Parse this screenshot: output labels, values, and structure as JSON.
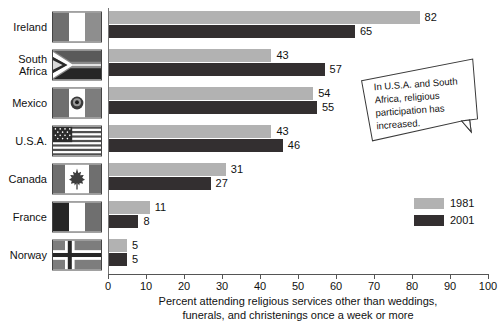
{
  "chart_data": {
    "type": "bar",
    "orientation": "horizontal",
    "title": "",
    "xlabel_line1": "Percent attending religious services other than weddings,",
    "xlabel_line2": "funerals, and christenings once a week or more",
    "ylabel": "",
    "xlim": [
      0,
      100
    ],
    "xticks": [
      0,
      10,
      20,
      30,
      40,
      50,
      60,
      70,
      80,
      90,
      100
    ],
    "xtick_labels": [
      "0",
      "10",
      "20",
      "30",
      "40",
      "50",
      "60",
      "70",
      "80",
      "90",
      "100"
    ],
    "grid": false,
    "legend_position": "right",
    "categories": [
      "Ireland",
      "South Africa",
      "Mexico",
      "U.S.A.",
      "Canada",
      "France",
      "Norway"
    ],
    "series": [
      {
        "name": "1981",
        "color": "#b2b2b2",
        "values": [
          82,
          43,
          54,
          43,
          31,
          11,
          5
        ]
      },
      {
        "name": "2001",
        "color": "#332f30",
        "values": [
          65,
          57,
          55,
          46,
          27,
          8,
          5
        ]
      }
    ],
    "annotations": [
      {
        "text": "In U.S.A. and South Africa, religious participation has increased."
      }
    ]
  },
  "rows": [
    {
      "label_line1": "Ireland",
      "label_line2": "",
      "flag": "flag-ireland",
      "v1981": 82,
      "v2001": 65,
      "v1981_text": "82",
      "v2001_text": "65"
    },
    {
      "label_line1": "South",
      "label_line2": "Africa",
      "flag": "flag-south-africa",
      "v1981": 43,
      "v2001": 57,
      "v1981_text": "43",
      "v2001_text": "57"
    },
    {
      "label_line1": "Mexico",
      "label_line2": "",
      "flag": "flag-mexico",
      "v1981": 54,
      "v2001": 55,
      "v1981_text": "54",
      "v2001_text": "55"
    },
    {
      "label_line1": "U.S.A.",
      "label_line2": "",
      "flag": "flag-usa",
      "v1981": 43,
      "v2001": 46,
      "v1981_text": "43",
      "v2001_text": "46"
    },
    {
      "label_line1": "Canada",
      "label_line2": "",
      "flag": "flag-canada",
      "v1981": 31,
      "v2001": 27,
      "v1981_text": "31",
      "v2001_text": "27"
    },
    {
      "label_line1": "France",
      "label_line2": "",
      "flag": "flag-france",
      "v1981": 11,
      "v2001": 8,
      "v1981_text": "11",
      "v2001_text": "8"
    },
    {
      "label_line1": "Norway",
      "label_line2": "",
      "flag": "flag-norway",
      "v1981": 5,
      "v2001": 5,
      "v1981_text": "5",
      "v2001_text": "5"
    }
  ],
  "legend": {
    "items": [
      {
        "label": "1981",
        "color": "#b2b2b2"
      },
      {
        "label": "2001",
        "color": "#332f30"
      }
    ]
  },
  "callout": {
    "text": "In U.S.A. and South Africa, religious participation has increased."
  },
  "axis": {
    "ticks": [
      "0",
      "10",
      "20",
      "30",
      "40",
      "50",
      "60",
      "70",
      "80",
      "90",
      "100"
    ],
    "title_line1": "Percent attending religious services other than weddings,",
    "title_line2": "funerals, and christenings once a week or more"
  },
  "colors": {
    "bar_1981": "#b2b2b2",
    "bar_2001": "#332f30",
    "axis": "#555555",
    "text": "#111111",
    "background": "#ffffff"
  }
}
